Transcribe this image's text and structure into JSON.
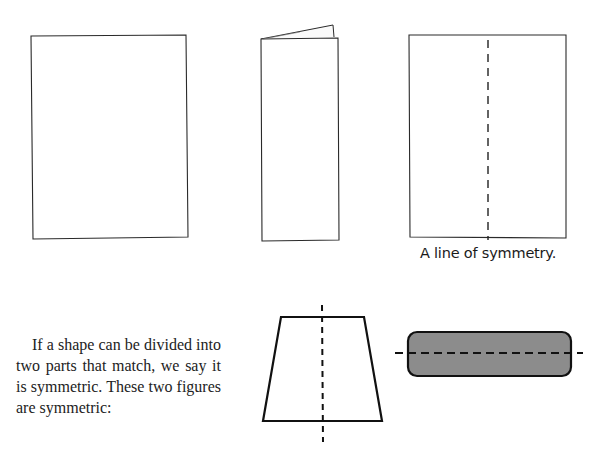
{
  "figures": {
    "top_row": [
      {
        "name": "sheet-of-paper",
        "description": "blank rectangular sheet"
      },
      {
        "name": "folded-paper",
        "description": "sheet folded in half vertically"
      },
      {
        "name": "unfolded-paper-with-fold-line",
        "description": "sheet with dashed vertical fold line"
      }
    ],
    "caption": "A line of symmetry.",
    "bottom_row": [
      {
        "name": "trapezoid",
        "axis": "vertical"
      },
      {
        "name": "rounded-rectangle",
        "axis": "horizontal",
        "fill": "#8c8c8c"
      }
    ]
  },
  "text": {
    "paragraph": "If a shape can be divided into two parts that match, we say it is symmetric. These two figures are symmetric:"
  },
  "colors": {
    "line": "#222222",
    "shape_fill": "#8c8c8c"
  }
}
